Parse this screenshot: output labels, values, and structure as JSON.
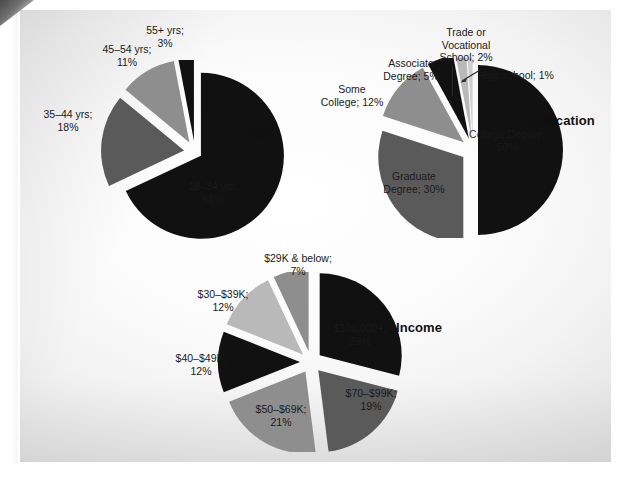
{
  "page": {
    "background_color": "#f2f2f2",
    "paper_color": "#ffffff"
  },
  "palette": {
    "black": "#111111",
    "dark_gray": "#5a5a5a",
    "mid_gray": "#8e8e8e",
    "light_gray": "#b9b9b9",
    "pale_gray": "#cfcfcf",
    "label_color": "#1a1a1a"
  },
  "charts": [
    {
      "id": "age",
      "title": "Age",
      "type": "pie",
      "exploded": true,
      "categories": [
        "18–34 yrs",
        "35–44 yrs",
        "45–54 yrs",
        "55+ yrs"
      ],
      "values": [
        68,
        18,
        11,
        3
      ],
      "labels": [
        "18–34 yrs;\n68%",
        "35–44 yrs;\n18%",
        "45–54 yrs;\n11%",
        "55+ yrs;\n3%"
      ],
      "label_lines": [
        [
          "18–34 yrs;",
          "68%"
        ],
        [
          "35–44 yrs;",
          "18%"
        ],
        [
          "45–54 yrs;",
          "11%"
        ],
        [
          "55+ yrs;",
          "3%"
        ]
      ],
      "slice_colors": [
        "#111111",
        "#5a5a5a",
        "#8e8e8e",
        "#111111"
      ]
    },
    {
      "id": "education",
      "title": "Education",
      "type": "pie",
      "exploded": true,
      "categories": [
        "College Degree",
        "Graduate Degree",
        "Some College",
        "Associate Degree",
        "Trade or Vocational School",
        "High school"
      ],
      "values": [
        50,
        30,
        12,
        5,
        2,
        1
      ],
      "labels": [
        "College Degree;\n50%",
        "Graduate\nDegree; 30%",
        "Some\nCollege; 12%",
        "Associate\nDegree; 5%",
        "Trade or\nVocational\nSchool; 2%",
        "High school; 1%"
      ],
      "label_lines": [
        [
          "College Degree;",
          "50%"
        ],
        [
          "Graduate",
          "Degree; 30%"
        ],
        [
          "Some",
          "College; 12%"
        ],
        [
          "Associate",
          "Degree; 5%"
        ],
        [
          "Trade or",
          "Vocational",
          "School; 2%"
        ],
        [
          "High school; 1%"
        ]
      ],
      "slice_colors": [
        "#111111",
        "#5a5a5a",
        "#8e8e8e",
        "#111111",
        "#b9b9b9",
        "#cfcfcf"
      ]
    },
    {
      "id": "income",
      "title": "Income",
      "type": "pie",
      "exploded": true,
      "categories": [
        "$100,000+",
        "$70–$99K",
        "$50–$69K",
        "$40–$49K",
        "$30–$39K",
        "$29K & below"
      ],
      "values": [
        29,
        19,
        21,
        12,
        12,
        7
      ],
      "labels": [
        "$100,000+;\n29%",
        "$70–$99K;\n19%",
        "$50–$69K;\n21%",
        "$40–$49K;\n12%",
        "$30–$39K;\n12%",
        "$29K & below;\n7%"
      ],
      "label_lines": [
        [
          "$100,000+;",
          "29%"
        ],
        [
          "$70–$99K;",
          "19%"
        ],
        [
          "$50–$69K;",
          "21%"
        ],
        [
          "$40–$49K;",
          "12%"
        ],
        [
          "$30–$39K;",
          "12%"
        ],
        [
          "$29K & below;",
          "7%"
        ]
      ],
      "slice_colors": [
        "#111111",
        "#5a5a5a",
        "#8e8e8e",
        "#111111",
        "#b9b9b9",
        "#8e8e8e"
      ]
    }
  ],
  "chart_data": [
    {
      "type": "pie",
      "title": "Age",
      "categories": [
        "18–34 yrs",
        "35–44 yrs",
        "45–54 yrs",
        "55+ yrs"
      ],
      "values": [
        68,
        18,
        11,
        3
      ],
      "unit": "percent",
      "legend": "none",
      "labels_inline": true
    },
    {
      "type": "pie",
      "title": "Education",
      "categories": [
        "College Degree",
        "Graduate Degree",
        "Some College",
        "Associate Degree",
        "Trade or Vocational School",
        "High school"
      ],
      "values": [
        50,
        30,
        12,
        5,
        2,
        1
      ],
      "unit": "percent",
      "legend": "none",
      "labels_inline": true
    },
    {
      "type": "pie",
      "title": "Income",
      "categories": [
        "$100,000+",
        "$70–$99K",
        "$50–$69K",
        "$40–$49K",
        "$30–$39K",
        "$29K & below"
      ],
      "values": [
        29,
        19,
        21,
        12,
        12,
        7
      ],
      "unit": "percent",
      "legend": "none",
      "labels_inline": true
    }
  ]
}
